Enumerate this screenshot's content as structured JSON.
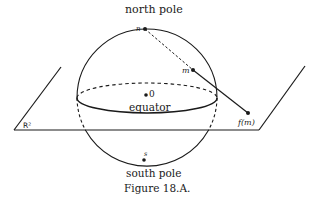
{
  "diagram": {
    "caption": "Figure 18.A.",
    "labels": {
      "north_pole": "north pole",
      "south_pole": "south pole",
      "equator": "equator",
      "origin": "0",
      "point_n": "n",
      "point_m": "m",
      "point_s": "s",
      "image_point": "f(m)",
      "plane": "R²"
    },
    "colors": {
      "ink": "#1a1a1a",
      "background": "#ffffff"
    }
  }
}
